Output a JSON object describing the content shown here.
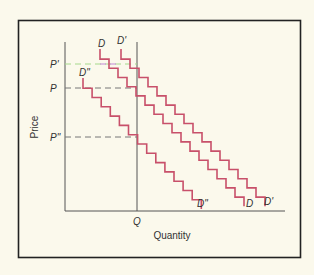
{
  "chart_data": {
    "type": "line",
    "title": "",
    "xlabel": "Quantity",
    "ylabel": "Price",
    "x_tick_labels": [
      "Q"
    ],
    "y_tick_labels": [
      "P'",
      "P",
      "P\""
    ],
    "grid": false,
    "legend": null,
    "step_style": "staircase",
    "series": [
      {
        "name": "D",
        "label_top": "D",
        "label_bottom": "D",
        "color": "#c8506a",
        "start": [
          100,
          49
        ],
        "step_dx": 9,
        "step_dy": 9.2,
        "steps": 16
      },
      {
        "name": "D'",
        "label_top": "D'",
        "label_bottom": "D'",
        "color": "#c8506a",
        "start": [
          121,
          49
        ],
        "step_dx": 9,
        "step_dy": 9.2,
        "steps": 16
      },
      {
        "name": "D\"",
        "label_top": "D\"",
        "label_bottom": "D\"",
        "color": "#c8506a",
        "start": [
          83,
          78
        ],
        "step_dx": 9.1,
        "step_dy": 9.3,
        "steps": 13
      }
    ],
    "reference_lines": [
      {
        "name": "P'",
        "type": "horizontal-dashed",
        "y_px": 64,
        "to_x_px": 137,
        "color": "#a6d98c"
      },
      {
        "name": "P",
        "type": "horizontal-dashed",
        "y_px": 88,
        "to_x_px": 137,
        "color": "#777777"
      },
      {
        "name": "P\"",
        "type": "horizontal-dashed",
        "y_px": 137,
        "to_x_px": 137,
        "color": "#777777"
      },
      {
        "name": "Q",
        "type": "vertical-solid",
        "x_px": 137,
        "from_y_px": 42,
        "to_y_px": 211,
        "color": "#555555"
      }
    ],
    "annotations": [
      "Three stepped demand curves D, D', D\" sloping downward",
      "Price levels P', P, P\" mark where each curve crosses quantity Q"
    ]
  },
  "labels": {
    "y_axis": "Price",
    "x_axis": "Quantity",
    "q_tick": "Q",
    "p_prime": "P'",
    "p": "P",
    "p_double_prime": "P\"",
    "d_top": "D",
    "d_prime_top": "D'",
    "d_double_prime_top": "D\"",
    "d_bottom": "D",
    "d_prime_bottom": "D'",
    "d_double_prime_bottom": "D\""
  },
  "colors": {
    "background": "#fbf9ec",
    "frame": "#222222",
    "axis": "#555555",
    "curve": "#c8506a",
    "dash": "#777777",
    "dash_highlight": "#a6d98c"
  }
}
